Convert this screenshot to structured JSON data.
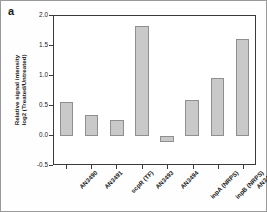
{
  "panel": {
    "label": "a"
  },
  "chart_data": {
    "type": "bar",
    "title": "",
    "xlabel": "",
    "ylabel": "Relative signal intensity log2 (Treated/Untreated)",
    "ylabel_line1": "Relative signal intensity",
    "ylabel_line2": "log2 (Treated/Untreated)",
    "categories": [
      "AN3490",
      "AN3491",
      "scpR (TF)",
      "AN3493",
      "AN3494",
      "inpA (NRPS)",
      "inpB (NRPS)",
      "AN3497"
    ],
    "values": [
      0.57,
      0.35,
      0.26,
      1.83,
      -0.1,
      0.6,
      0.97,
      1.62
    ],
    "ylim": [
      -0.5,
      2.0
    ],
    "yticks": [
      "2.0",
      "1.5",
      "1.0",
      "0.5",
      "0.0",
      "-0.5"
    ],
    "ytick_values": [
      2.0,
      1.5,
      1.0,
      0.5,
      0.0,
      -0.5
    ],
    "grid": false,
    "legend": false,
    "bar_color": "#c9c9c9",
    "bar_edge_color": "#8f8f8f",
    "axis_color": "#3a3a3a"
  }
}
